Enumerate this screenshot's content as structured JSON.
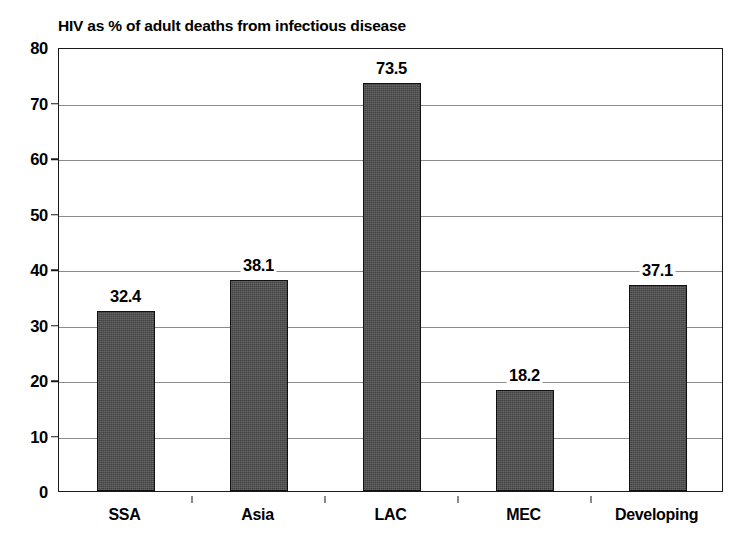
{
  "chart_data": {
    "type": "bar",
    "title": "HIV as % of adult deaths from infectious disease",
    "xlabel": "",
    "ylabel": "",
    "categories": [
      "SSA",
      "Asia",
      "LAC",
      "MEC",
      "Developing"
    ],
    "values": [
      32.4,
      38.1,
      73.5,
      18.2,
      37.1
    ],
    "value_labels": [
      "32.4",
      "38.1",
      "73.5",
      "18.2",
      "37.1"
    ],
    "ylim": [
      0,
      80
    ],
    "ytick_labels": [
      "80",
      "70",
      "60",
      "50",
      "40",
      "30",
      "20",
      "10",
      "0"
    ],
    "ytick_values": [
      80,
      70,
      60,
      50,
      40,
      30,
      20,
      10,
      0
    ],
    "ytick_step": 10,
    "grid": true,
    "grid_axis": "y",
    "legend": false,
    "legend_position": "none",
    "bar_color": "#4a4a4a",
    "bar_edge_color": "#111111",
    "grid_color": "#8a8a8a",
    "axis_color": "#1a1a1a",
    "text_color": "#000000",
    "plot_background": "#ffffff",
    "figure_background": "#ffffff"
  }
}
